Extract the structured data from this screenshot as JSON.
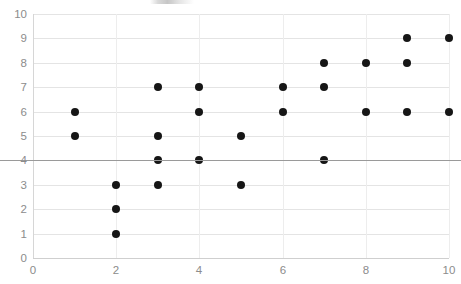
{
  "chart_data": {
    "type": "scatter",
    "title": "",
    "xlabel": "",
    "ylabel": "",
    "xlim": [
      0,
      10
    ],
    "ylim": [
      0,
      10
    ],
    "x_ticks": [
      0,
      2,
      4,
      6,
      8,
      10
    ],
    "y_ticks": [
      0,
      1,
      2,
      3,
      4,
      5,
      6,
      7,
      8,
      9,
      10
    ],
    "grid": true,
    "legend": "none",
    "marker_color": "#161616",
    "marker_shape": "circle",
    "emphasis_line_y": 4,
    "emphasis_line_color": "#9a9a9a",
    "point_count": 24,
    "points": [
      {
        "x": 1,
        "y": 6
      },
      {
        "x": 1,
        "y": 5
      },
      {
        "x": 2,
        "y": 3
      },
      {
        "x": 2,
        "y": 2
      },
      {
        "x": 2,
        "y": 1
      },
      {
        "x": 3,
        "y": 7
      },
      {
        "x": 3,
        "y": 5
      },
      {
        "x": 3,
        "y": 4
      },
      {
        "x": 3,
        "y": 3
      },
      {
        "x": 4,
        "y": 7
      },
      {
        "x": 4,
        "y": 6
      },
      {
        "x": 4,
        "y": 4
      },
      {
        "x": 5,
        "y": 5
      },
      {
        "x": 5,
        "y": 3
      },
      {
        "x": 6,
        "y": 7
      },
      {
        "x": 6,
        "y": 6
      },
      {
        "x": 7,
        "y": 8
      },
      {
        "x": 7,
        "y": 7
      },
      {
        "x": 7,
        "y": 4
      },
      {
        "x": 8,
        "y": 8
      },
      {
        "x": 8,
        "y": 6
      },
      {
        "x": 9,
        "y": 9
      },
      {
        "x": 9,
        "y": 8
      },
      {
        "x": 9,
        "y": 6
      },
      {
        "x": 10,
        "y": 9
      },
      {
        "x": 10,
        "y": 6
      }
    ]
  }
}
